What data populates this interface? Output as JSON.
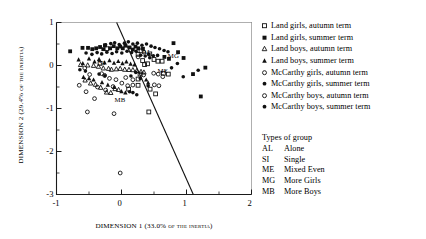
{
  "chart_data": {
    "type": "scatter",
    "title": "",
    "xlabel": "DIMENSION 1 (33.0% of the inertia)",
    "ylabel": "DIMENSION 2 (29.4% of the inertia)",
    "xlim": [
      -1,
      2
    ],
    "ylim": [
      -3,
      1
    ],
    "xticks": [
      -1,
      0,
      1,
      2
    ],
    "yticks": [
      1,
      0,
      -1,
      -2,
      -3
    ],
    "xticklabels": [
      "-1",
      "0",
      "1",
      "2"
    ],
    "yticklabels": [
      "1",
      "0",
      "-1",
      "-2",
      "-3"
    ],
    "grid": false,
    "legend_position": "right",
    "annotations": [
      {
        "text": "AL",
        "x": 0.395,
        "y": 0.305
      },
      {
        "text": "SI",
        "x": -0.27,
        "y": 0.05
      },
      {
        "text": "ME",
        "x": 0.63,
        "y": -0.12
      },
      {
        "text": "MG",
        "x": 0.79,
        "y": 0.21
      },
      {
        "text": "MB",
        "x": -0.03,
        "y": -0.8
      }
    ],
    "reference_line": {
      "x1": -0.075,
      "y1": 1.0,
      "x2": 1.105,
      "y2": -3.0
    },
    "series": [
      {
        "name": "Land girls, autumn term",
        "marker": "open-square",
        "points": [
          [
            0.3,
            0.34
          ],
          [
            0.255,
            0.26
          ],
          [
            0.435,
            0.27
          ],
          [
            0.5,
            0.14
          ],
          [
            0.56,
            0.1
          ],
          [
            0.625,
            0.1
          ],
          [
            0.4,
            0.04
          ],
          [
            0.355,
            0.02
          ],
          [
            0.325,
            0.115
          ],
          [
            0.645,
            -0.18
          ],
          [
            0.72,
            -0.2
          ],
          [
            0.285,
            -0.2
          ],
          [
            0.255,
            -0.46
          ],
          [
            0.11,
            -0.55
          ],
          [
            -0.33,
            0.05
          ],
          [
            -0.225,
            0.39
          ],
          [
            0.44,
            -0.55
          ],
          [
            0.525,
            -0.66
          ],
          [
            0.42,
            -1.08
          ],
          [
            0.255,
            -0.315
          ]
        ]
      },
      {
        "name": "Land girls, summer term",
        "marker": "filled-square",
        "points": [
          [
            -0.79,
            0.33
          ],
          [
            -0.6,
            0.41
          ],
          [
            -0.515,
            0.41
          ],
          [
            -0.45,
            0.38
          ],
          [
            -0.39,
            0.4
          ],
          [
            -0.33,
            0.43
          ],
          [
            -0.28,
            0.38
          ],
          [
            -0.255,
            0.47
          ],
          [
            -0.175,
            0.4
          ],
          [
            -0.12,
            0.45
          ],
          [
            -0.065,
            0.4
          ],
          [
            -0.02,
            0.44
          ],
          [
            0.02,
            0.4
          ],
          [
            0.06,
            0.46
          ],
          [
            0.125,
            0.42
          ],
          [
            0.175,
            0.37
          ],
          [
            0.215,
            0.44
          ],
          [
            0.26,
            0.4
          ],
          [
            0.33,
            0.39
          ],
          [
            0.8,
            0.52
          ],
          [
            0.87,
            0.31
          ],
          [
            0.955,
            0.175
          ],
          [
            1.29,
            -0.05
          ],
          [
            1.1,
            -0.2
          ],
          [
            1.22,
            -0.72
          ],
          [
            0.66,
            0.2
          ],
          [
            0.73,
            0.155
          ]
        ]
      },
      {
        "name": "Land boys, autumn term",
        "marker": "open-triangle",
        "points": [
          [
            -0.63,
            0.02
          ],
          [
            -0.52,
            0.01
          ],
          [
            -0.43,
            0.0
          ],
          [
            -0.355,
            -0.02
          ],
          [
            -0.28,
            -0.06
          ],
          [
            -0.2,
            -0.07
          ],
          [
            -0.155,
            -0.09
          ],
          [
            -0.08,
            -0.08
          ],
          [
            -0.02,
            -0.07
          ],
          [
            0.05,
            -0.09
          ],
          [
            0.115,
            -0.095
          ],
          [
            0.175,
            -0.1
          ],
          [
            0.235,
            -0.12
          ],
          [
            0.3,
            -0.14
          ],
          [
            0.345,
            -0.155
          ],
          [
            -0.56,
            -0.34
          ],
          [
            -0.475,
            -0.41
          ],
          [
            -0.4,
            -0.44
          ],
          [
            -0.32,
            -0.51
          ],
          [
            -0.23,
            -0.62
          ],
          [
            -0.165,
            -0.63
          ],
          [
            -0.1,
            -0.54
          ],
          [
            -0.045,
            -0.56
          ]
        ]
      },
      {
        "name": "Land boys, summer term",
        "marker": "filled-triangle",
        "points": [
          [
            -0.66,
            0.14
          ],
          [
            -0.595,
            0.05
          ],
          [
            -0.5,
            0.16
          ],
          [
            -0.415,
            0.09
          ],
          [
            -0.345,
            0.15
          ],
          [
            -0.26,
            0.07
          ],
          [
            -0.185,
            0.12
          ],
          [
            -0.115,
            0.06
          ],
          [
            -0.05,
            0.1
          ],
          [
            0.015,
            0.05
          ],
          [
            0.075,
            0.09
          ],
          [
            0.14,
            0.04
          ],
          [
            0.2,
            0.02
          ],
          [
            -0.585,
            -0.27
          ],
          [
            -0.5,
            -0.3
          ],
          [
            -0.43,
            -0.33
          ],
          [
            -0.3,
            -0.39
          ],
          [
            -0.21,
            -0.45
          ],
          [
            -0.115,
            -0.5
          ],
          [
            0.0,
            -0.6
          ],
          [
            0.06,
            -0.63
          ],
          [
            0.38,
            -0.33
          ],
          [
            0.41,
            -0.4
          ]
        ]
      },
      {
        "name": "McCarthy girls, autumn term",
        "marker": "open-circle",
        "points": [
          [
            -0.565,
            -0.06
          ],
          [
            -0.49,
            -0.21
          ],
          [
            -0.65,
            -0.46
          ],
          [
            -0.545,
            -0.61
          ],
          [
            -0.37,
            -0.5
          ],
          [
            -0.245,
            -0.57
          ],
          [
            -0.13,
            -0.49
          ],
          [
            -0.415,
            -0.77
          ],
          [
            -0.525,
            -1.08
          ],
          [
            -0.115,
            -1.12
          ],
          [
            -0.02,
            -2.5
          ],
          [
            0.34,
            -0.22
          ],
          [
            0.345,
            0.31
          ],
          [
            0.255,
            0.2
          ],
          [
            0.175,
            -0.455
          ],
          [
            -0.26,
            -0.23
          ],
          [
            0.505,
            -0.45
          ],
          [
            0.575,
            -0.47
          ]
        ]
      },
      {
        "name": "McCarthy girls, summer term",
        "marker": "filled-circle",
        "points": [
          [
            -0.245,
            0.48
          ],
          [
            -0.165,
            0.51
          ],
          [
            -0.105,
            0.53
          ],
          [
            -0.035,
            0.49
          ],
          [
            0.045,
            0.52
          ],
          [
            0.105,
            0.55
          ],
          [
            0.175,
            0.5
          ],
          [
            0.245,
            0.52
          ],
          [
            0.315,
            0.47
          ],
          [
            0.385,
            0.5
          ],
          [
            0.455,
            0.45
          ],
          [
            0.515,
            0.42
          ],
          [
            0.585,
            0.39
          ],
          [
            0.655,
            0.35
          ],
          [
            0.715,
            0.32
          ],
          [
            0.555,
            0.235
          ],
          [
            0.49,
            0.225
          ],
          [
            0.42,
            0.26
          ],
          [
            0.86,
            0.045
          ],
          [
            0.77,
            -0.055
          ],
          [
            0.95,
            -0.26
          ],
          [
            1.18,
            -0.11
          ]
        ]
      },
      {
        "name": "McCarthy boys, autumn term",
        "marker": "open-circle",
        "points": [
          [
            -0.185,
            -0.3
          ],
          [
            -0.085,
            -0.33
          ],
          [
            0.005,
            -0.41
          ],
          [
            0.095,
            -0.47
          ],
          [
            0.175,
            -0.33
          ],
          [
            0.065,
            -0.28
          ],
          [
            -0.305,
            -0.19
          ],
          [
            0.565,
            -0.2
          ],
          [
            0.495,
            -0.18
          ],
          [
            0.635,
            -0.26
          ]
        ]
      },
      {
        "name": "McCarthy boys, summer term",
        "marker": "filled-circle",
        "points": [
          [
            -0.545,
            0.29
          ],
          [
            -0.455,
            0.26
          ],
          [
            -0.375,
            0.3
          ],
          [
            -0.305,
            0.27
          ],
          [
            -0.225,
            0.31
          ],
          [
            -0.145,
            0.28
          ],
          [
            -0.075,
            0.32
          ],
          [
            0.005,
            0.29
          ],
          [
            0.085,
            0.33
          ],
          [
            0.155,
            0.3
          ],
          [
            0.225,
            0.33
          ],
          [
            0.295,
            0.24
          ],
          [
            0.365,
            0.22
          ],
          [
            0.435,
            0.18
          ],
          [
            -0.64,
            -0.1
          ],
          [
            -0.555,
            -0.13
          ],
          [
            -0.345,
            -0.2
          ],
          [
            -0.255,
            -0.24
          ],
          [
            0.22,
            -0.16
          ],
          [
            0.145,
            -0.245
          ],
          [
            0.29,
            -0.3
          ],
          [
            0.41,
            -0.47
          ],
          [
            0.125,
            -0.61
          ],
          [
            0.175,
            -0.63
          ],
          [
            0.235,
            -0.68
          ]
        ]
      }
    ]
  },
  "legend": {
    "items": [
      {
        "marker": "open-square",
        "label": "Land girls, autumn term"
      },
      {
        "marker": "filled-square",
        "label": "Land girls, summer term"
      },
      {
        "marker": "open-triangle",
        "label": "Land boys, autumn term"
      },
      {
        "marker": "filled-triangle",
        "label": "Land boys, summer term"
      },
      {
        "marker": "open-circle",
        "label": "McCarthy girls, autumn term"
      },
      {
        "marker": "filled-circle",
        "label": "McCarthy girls, summer term"
      },
      {
        "marker": "open-circle",
        "label": "McCarthy boys, autumn term"
      },
      {
        "marker": "filled-circle",
        "label": "McCarthy boys, summer term"
      }
    ]
  },
  "groups": {
    "heading": "Types of group",
    "rows": [
      {
        "code": "AL",
        "name": "Alone"
      },
      {
        "code": "SI",
        "name": "Single"
      },
      {
        "code": "ME",
        "name": "Mixed Even"
      },
      {
        "code": "MG",
        "name": "More Girls"
      },
      {
        "code": "MB",
        "name": "More Boys"
      }
    ]
  },
  "axes": {
    "x_title": "DIMENSION 1 (33.0% of the inertia)",
    "y_title": "DIMENSION 2 (29.4% of the inertia)"
  }
}
